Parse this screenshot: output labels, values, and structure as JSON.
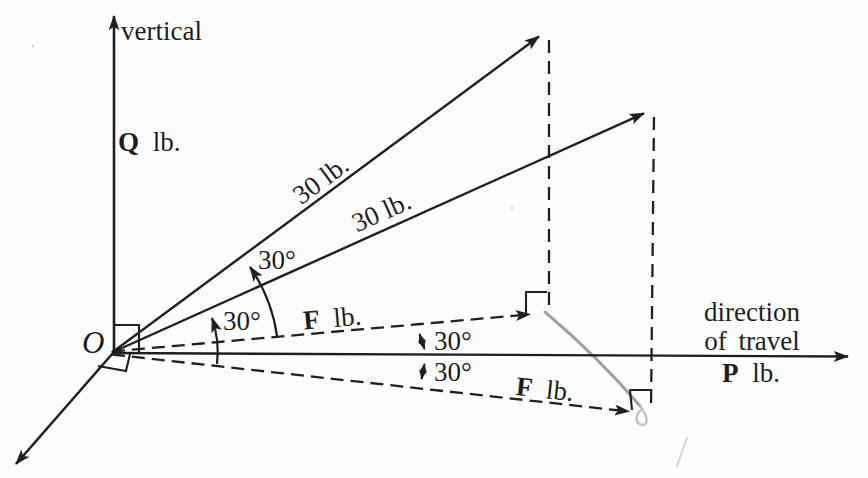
{
  "figure": {
    "colors": {
      "ink": "#1f1f1f",
      "paper": "#fdfdfd",
      "pencil": "#a6a6a6"
    },
    "labels": {
      "vertical_axis": "vertical",
      "q_force": {
        "sym": "Q",
        "unit": "lb."
      },
      "origin": "O",
      "rope1_magnitude": "30 lb.",
      "rope2_magnitude": "30 lb.",
      "angle_rope1": "30°",
      "angle_rope2": "30°",
      "angle_projection_upper": "30°",
      "angle_projection_lower": "30°",
      "f_upper": {
        "sym": "F",
        "unit": "lb."
      },
      "f_lower": {
        "sym": "F",
        "unit": "lb."
      },
      "direction_line1": "direction",
      "direction_line2": "of travel",
      "p_force": {
        "sym": "P",
        "unit": "lb."
      }
    }
  }
}
